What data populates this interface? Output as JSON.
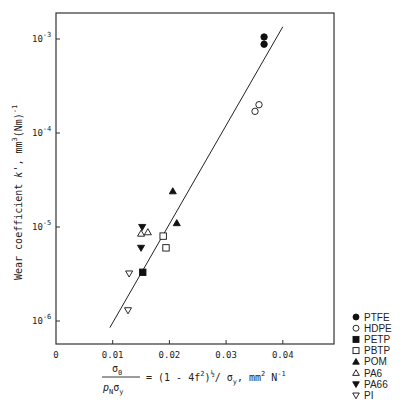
{
  "chart_data": {
    "type": "scatter",
    "title": "",
    "xlabel": "σ0 / (pN σy) = (1 - 4f²)^½ / σy, mm² N⁻¹",
    "xlabel_parts": {
      "num": "σ",
      "num_sub": "0",
      "den": "p",
      "den_sub": "N",
      "den2": "σ",
      "den2_sub": "y",
      "rhs": "= (1 - 4f",
      "rhs_sup": "2",
      "rhs_mid": ")",
      "rhs_half": "½",
      "rhs_after": "/ σ",
      "rhs_sub": "y",
      "rhs_units": ", mm",
      "rhs_units_sup": "2",
      "rhs_units2": " N",
      "rhs_units2_sup": "-1"
    },
    "ylabel": "Wear coefficient k', mm³(Nm)⁻¹",
    "ylabel_parts": {
      "main": "Wear coefficient ",
      "k": "k",
      "rest": "', mm",
      "sup3": "3",
      "nm": "(Nm)",
      "sup_neg1": "-1"
    },
    "xlim": [
      0,
      0.0489
    ],
    "ylim_log10": [
      -6.25,
      -2.72
    ],
    "y_scale": "log",
    "grid": false,
    "x_ticks": [
      {
        "value": 0,
        "label": "0"
      },
      {
        "value": 0.01,
        "label": "0.01"
      },
      {
        "value": 0.02,
        "label": "0.02"
      },
      {
        "value": 0.03,
        "label": "0.03"
      },
      {
        "value": 0.04,
        "label": "0.04"
      }
    ],
    "y_ticks": [
      {
        "exp": -3,
        "base": "10",
        "sup": "-3"
      },
      {
        "exp": -4,
        "base": "10",
        "sup": "-4"
      },
      {
        "exp": -5,
        "base": "10",
        "sup": "-5"
      },
      {
        "exp": -6,
        "base": "10",
        "sup": "-6"
      }
    ],
    "legend_position": "bottom-right-outside",
    "series": [
      {
        "name": "PTFE",
        "marker": "circle",
        "filled": true,
        "points": [
          [
            0.0367,
            0.00105
          ],
          [
            0.0367,
            0.00088
          ]
        ]
      },
      {
        "name": "HDPE",
        "marker": "circle",
        "filled": false,
        "points": [
          [
            0.0358,
            0.0002
          ],
          [
            0.0351,
            0.00017
          ]
        ]
      },
      {
        "name": "PETP",
        "marker": "square",
        "filled": true,
        "points": [
          [
            0.0153,
            3.3e-06
          ]
        ]
      },
      {
        "name": "PBTP",
        "marker": "square",
        "filled": false,
        "points": [
          [
            0.0189,
            8e-06
          ],
          [
            0.0194,
            6e-06
          ]
        ]
      },
      {
        "name": "POM",
        "marker": "triangle-up",
        "filled": true,
        "points": [
          [
            0.0206,
            2.4e-05
          ],
          [
            0.0213,
            1.1e-05
          ]
        ]
      },
      {
        "name": "PA6",
        "marker": "triangle-up",
        "filled": false,
        "points": [
          [
            0.015,
            8.5e-06
          ],
          [
            0.0162,
            8.8e-06
          ]
        ]
      },
      {
        "name": "PA66",
        "marker": "triangle-down",
        "filled": true,
        "points": [
          [
            0.0152,
            1e-05
          ],
          [
            0.015,
            6e-06
          ]
        ]
      },
      {
        "name": "PI",
        "marker": "triangle-down",
        "filled": false,
        "points": [
          [
            0.0129,
            3.2e-06
          ],
          [
            0.0127,
            1.3e-06
          ]
        ]
      }
    ],
    "fit_line": {
      "points": [
        [
          0.0095,
          8.5e-07
        ],
        [
          0.04,
          0.00135
        ]
      ]
    }
  }
}
